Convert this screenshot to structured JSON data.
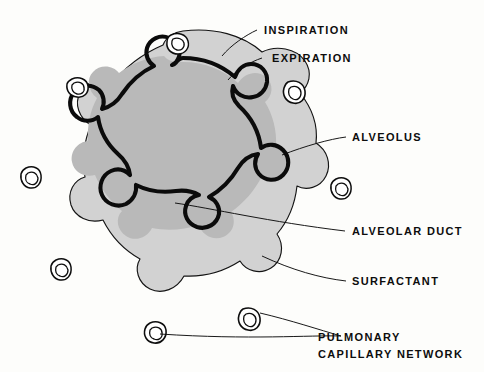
{
  "figure": {
    "background_color": "#fdfdfb",
    "ink_color": "#0d0d0d",
    "wall_fill_color": "#d2d2d2",
    "surfactant_color": "#b9b9b9",
    "lumen_color": "#ffffff"
  },
  "labels": {
    "inspiration": "INSPIRATION",
    "expiration": "EXPIRATION",
    "alveolus": "ALVEOLUS",
    "alveolar_duct": "ALVEOLAR  DUCT",
    "surfactant": "SURFACTANT",
    "pulmonary_line1": "PULMONARY",
    "pulmonary_line2": "CAPILLARY  NETWORK"
  },
  "structures": {
    "outer_wall_name": "expiration-outline",
    "inner_wall_name": "inspiration-outline",
    "surfactant_name": "surfactant-layer",
    "lumen_name": "alveolar-duct-lumen",
    "capillary_count": 8
  }
}
